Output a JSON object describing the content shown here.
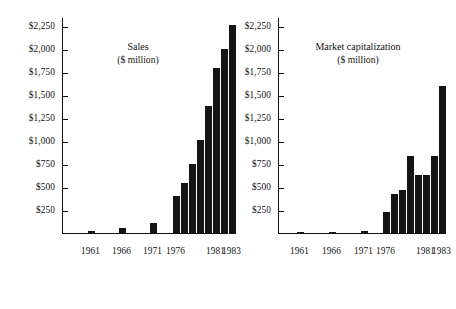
{
  "figure": {
    "currency_prefix": "$",
    "axis_max": 2350,
    "tick_values": [
      250,
      500,
      750,
      1000,
      1250,
      1500,
      1750,
      2000,
      2250
    ],
    "tick_labels": [
      "$250",
      "$500",
      "$750",
      "$1,000",
      "$1,250",
      "$1,500",
      "$1,750",
      "$2,000",
      "$2,250"
    ],
    "bar_color": "#141414",
    "axis_color": "#111111"
  },
  "panels": [
    {
      "id": "sales",
      "title_line1": "Sales",
      "title_line2": "($ million)",
      "x_tick_labels": [
        "1961",
        "1966",
        "1971",
        "1976",
        "1981",
        "1983"
      ]
    },
    {
      "id": "market-capitalization",
      "title_line1": "Market capitalization",
      "title_line2": "($ million)",
      "x_tick_labels": [
        "1961",
        "1966",
        "1971",
        "1976",
        "1981",
        "1983"
      ]
    }
  ],
  "chart_data": [
    {
      "type": "bar",
      "title": "Sales ($ million)",
      "xlabel": "",
      "ylabel": "$ million",
      "ylim": [
        0,
        2350
      ],
      "grid": false,
      "legend": "none",
      "ytick_labels": [
        "$250",
        "$500",
        "$750",
        "$1,000",
        "$1,250",
        "$1,500",
        "$1,750",
        "$2,000",
        "$2,250"
      ],
      "yticks": [
        250,
        500,
        750,
        1000,
        1250,
        1500,
        1750,
        2000,
        2250
      ],
      "xtick_labels": [
        "1961",
        "1966",
        "1971",
        "1976",
        "1981",
        "1983"
      ],
      "categories": [
        "1961",
        "1966",
        "1971",
        "1976",
        "1977",
        "1978",
        "1979",
        "1980",
        "1981",
        "1982",
        "1983"
      ],
      "values": [
        30,
        65,
        115,
        415,
        560,
        760,
        1020,
        1390,
        1810,
        2015,
        2270
      ]
    },
    {
      "type": "bar",
      "title": "Market capitalization ($ million)",
      "xlabel": "",
      "ylabel": "$ million",
      "ylim": [
        0,
        2350
      ],
      "grid": false,
      "legend": "none",
      "ytick_labels": [
        "$250",
        "$500",
        "$750",
        "$1,000",
        "$1,250",
        "$1,500",
        "$1,750",
        "$2,000",
        "$2,250"
      ],
      "yticks": [
        250,
        500,
        750,
        1000,
        1250,
        1500,
        1750,
        2000,
        2250
      ],
      "xtick_labels": [
        "1961",
        "1966",
        "1971",
        "1976",
        "1981",
        "1983"
      ],
      "categories": [
        "1961",
        "1966",
        "1971",
        "1976",
        "1977",
        "1978",
        "1979",
        "1980",
        "1981",
        "1982",
        "1983"
      ],
      "values": [
        25,
        25,
        35,
        235,
        440,
        475,
        845,
        645,
        645,
        845,
        1610
      ]
    }
  ]
}
